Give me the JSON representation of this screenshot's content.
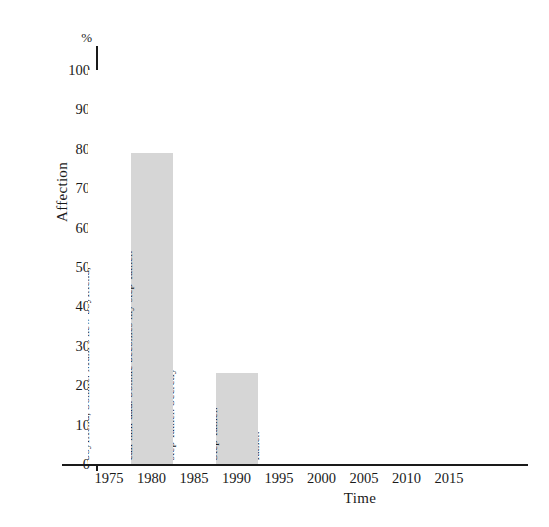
{
  "chart_data": {
    "type": "bar",
    "title": "",
    "xlabel": "Time",
    "ylabel": "Affection",
    "yunit": "%",
    "ylim": [
      0,
      100
    ],
    "xlim": [
      1972.5,
      2017.5
    ],
    "grid": false,
    "legend": "none",
    "ytick_labels": [
      "0",
      "10",
      "20",
      "30",
      "40",
      "50",
      "60",
      "70",
      "80",
      "90",
      "100"
    ],
    "ytick_values": [
      0,
      10,
      20,
      30,
      40,
      50,
      60,
      70,
      80,
      90,
      100
    ],
    "xtick_labels": [
      "1975",
      "1980",
      "1985",
      "1990",
      "1995",
      "2000",
      "2005",
      "2010",
      "2015"
    ],
    "xtick_values": [
      1975,
      1980,
      1985,
      1990,
      1995,
      2000,
      2005,
      2010,
      2015
    ],
    "categories": [
      "1975",
      "1980",
      "1985",
      "1990",
      "1995"
    ],
    "values": [
      100,
      79,
      36,
      23,
      13
    ],
    "colors": [
      "#ffffff",
      "#d6d6d6",
      "#ffffff",
      "#d6d6d6",
      "#ffffff"
    ],
    "bars": [
      {
        "category": "1975",
        "value": 100,
        "color": "#ffffff",
        "annotation_lines": [
          "Mum’s new boyfriend, Sonnie. Mum’s new",
          "boyfriend, Sonnie. Mum’s new boyfriend,"
        ],
        "annotation": "Mum’s new boyfriend, Sonnie. Mum’s new boyfriend, Sonnie. Mum’s new boyfriend,"
      },
      {
        "category": "1980",
        "value": 79,
        "color": "#d6d6d6",
        "annotation_lines": [
          "Sonnie becomes my step-father. He asks me to",
          "call him dad. Sonnie becomes my step-father."
        ],
        "annotation": "Sonnie becomes my step-father. He asks me to call him dad. Sonnie becomes my step-father."
      },
      {
        "category": "1985",
        "value": 36,
        "color": "#ffffff",
        "annotation_lines": [
          "Secretly, I call him",
          "step-father. Secretly"
        ],
        "annotation": "Secretly, I call him step-father. Secretly"
      },
      {
        "category": "1990",
        "value": 23,
        "color": "#d6d6d6",
        "annotation_lines": [
          "Step-father.",
          "Step-father."
        ],
        "annotation": "Step-father. Step-father."
      },
      {
        "category": "1995",
        "value": 13,
        "color": "#ffffff",
        "annotation_lines": [
          "Step-",
          "father."
        ],
        "annotation": "Step-father."
      }
    ]
  },
  "axes": {
    "y_unit_label": "%",
    "y_title": "Affection",
    "x_title": "Time"
  }
}
